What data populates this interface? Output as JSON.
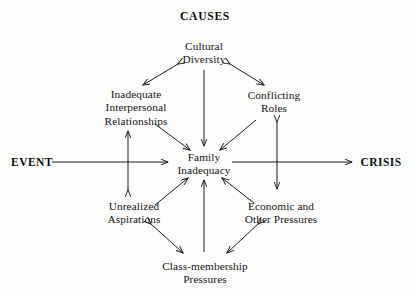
{
  "diagram": {
    "heading": "CAUSES",
    "axis": {
      "start_label": "EVENT",
      "end_label": "CRISIS"
    },
    "center_node": {
      "line1": "Family",
      "line2": "Inadequacy"
    },
    "nodes": [
      {
        "id": "cultural-diversity",
        "line1": "Cultural",
        "line2": "Diversity",
        "line3": ""
      },
      {
        "id": "inadequate-interpersonal-relationships",
        "line1": "Inadequate",
        "line2": "Interpersonal",
        "line3": "Relationships"
      },
      {
        "id": "conflicting-roles",
        "line1": "Conflicting",
        "line2": "Roles",
        "line3": ""
      },
      {
        "id": "unrealized-aspirations",
        "line1": "Unrealized",
        "line2": "Aspirations",
        "line3": ""
      },
      {
        "id": "economic-and-other-pressures",
        "line1": "Economic and",
        "line2": "Other Pressures",
        "line3": ""
      },
      {
        "id": "class-membership-pressures",
        "line1": "Class-membership",
        "line2": "Pressures",
        "line3": ""
      }
    ],
    "colors": {
      "background": "#fdfdfc",
      "ink": "#141414",
      "stroke": "#1b1b1b"
    }
  }
}
